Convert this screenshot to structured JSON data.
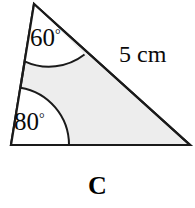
{
  "figure": {
    "caption": "C",
    "shape": "triangle",
    "fill_color": "#ededed",
    "stroke_color": "#1a1a1a",
    "background_color": "#ffffff",
    "vertices": {
      "apex": [
        34,
        4
      ],
      "bottom_left": [
        11,
        145
      ],
      "bottom_right": [
        190,
        145
      ]
    },
    "angles": [
      {
        "id": "apex",
        "value": "60",
        "degree_symbol": "°",
        "arc_radius": 58,
        "at_vertex": "apex"
      },
      {
        "id": "bottom-left",
        "value": "80",
        "degree_symbol": "°",
        "arc_radius": 58,
        "at_vertex": "bottom_left"
      }
    ],
    "side_labels": [
      {
        "id": "hypotenuse",
        "text": "5 cm",
        "measure": "5",
        "unit": "cm",
        "on_side": "apex-to-bottom-right"
      }
    ]
  }
}
